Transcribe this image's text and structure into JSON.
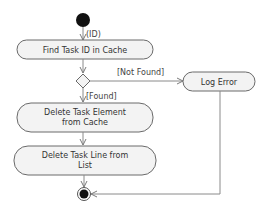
{
  "diagram": {
    "type": "uml-activity",
    "colors": {
      "node_fill": "#f3f3f3",
      "node_stroke": "#6a6a6a",
      "edge": "#8a8a8a",
      "initial": "#111111",
      "text": "#333333"
    },
    "initial_node": {
      "label": "(ID)"
    },
    "actions": [
      {
        "id": "find",
        "label_lines": [
          "Find Task ID in Cache"
        ]
      },
      {
        "id": "log",
        "label_lines": [
          "Log Error"
        ]
      },
      {
        "id": "delete-element",
        "label_lines": [
          "Delete Task Element",
          "from Cache"
        ]
      },
      {
        "id": "delete-line",
        "label_lines": [
          "Delete Task Line from",
          "List"
        ]
      }
    ],
    "decision": {
      "guards": {
        "not_found": "[Not Found]",
        "found": "[Found]"
      }
    },
    "final_node": {}
  }
}
